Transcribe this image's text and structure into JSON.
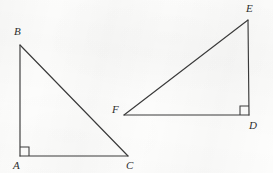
{
  "figure": {
    "type": "geometry-diagram",
    "stroke_color": "#3a3a3a",
    "background_color": "#fdfdfc",
    "label_color": "#2e2e2e",
    "width": 273,
    "height": 173,
    "shapes": [
      {
        "name": "triangle-abc",
        "label": "ABC",
        "right_angle_vertex": "A",
        "vertices": [
          {
            "id": "A",
            "x": 20,
            "y": 156,
            "label": "A",
            "label_x": 13,
            "label_y": 160
          },
          {
            "id": "B",
            "x": 20,
            "y": 45,
            "label": "B",
            "label_x": 14,
            "label_y": 26
          },
          {
            "id": "C",
            "x": 128,
            "y": 156,
            "label": "C",
            "label_x": 126,
            "label_y": 160
          }
        ],
        "edges": [
          {
            "from": "A",
            "to": "B",
            "name": "leg-ab"
          },
          {
            "from": "B",
            "to": "C",
            "name": "hypotenuse-bc"
          },
          {
            "from": "A",
            "to": "C",
            "name": "leg-ac"
          }
        ],
        "right_angle_mark": {
          "x": 20,
          "y": 156,
          "size": 9,
          "dir_x": 1,
          "dir_y": -1
        }
      },
      {
        "name": "triangle-def",
        "label": "DEF",
        "right_angle_vertex": "D",
        "vertices": [
          {
            "id": "D",
            "x": 249,
            "y": 115,
            "label": "D",
            "label_x": 249,
            "label_y": 120
          },
          {
            "id": "E",
            "x": 248,
            "y": 20,
            "label": "E",
            "label_x": 246,
            "label_y": 3
          },
          {
            "id": "F",
            "x": 124,
            "y": 115,
            "label": "F",
            "label_x": 112,
            "label_y": 104
          }
        ],
        "edges": [
          {
            "from": "D",
            "to": "E",
            "name": "leg-de"
          },
          {
            "from": "E",
            "to": "F",
            "name": "hypotenuse-ef"
          },
          {
            "from": "F",
            "to": "D",
            "name": "leg-fd"
          }
        ],
        "right_angle_mark": {
          "x": 249,
          "y": 115,
          "size": 9,
          "dir_x": -1,
          "dir_y": -1
        }
      }
    ]
  }
}
